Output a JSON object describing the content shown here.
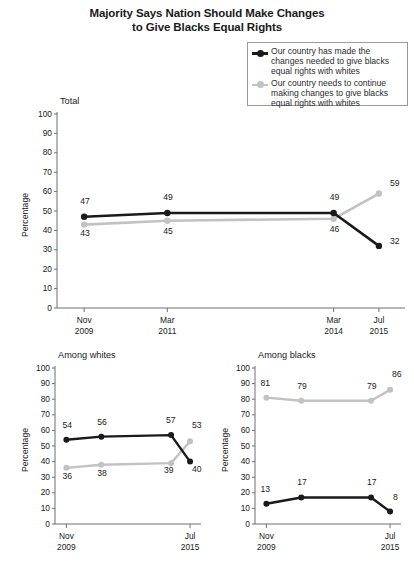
{
  "title": {
    "line1": "Majority Says Nation Should Make Changes",
    "line2": "to Give Blacks Equal Rights"
  },
  "legend": {
    "items": [
      {
        "label": "Our country has made the changes needed to give blacks equal rights with whites",
        "color": "#1a1a1a",
        "marker": "black-dot-line-marker"
      },
      {
        "label": "Our country needs to continue making changes to give blacks equal rights with whites",
        "color": "#c2c2c2",
        "marker": "gray-dot-line-marker"
      }
    ]
  },
  "colors": {
    "series_made_changes": "#1a1a1a",
    "series_needs_changes": "#c2c2c2",
    "axis": "#6f6f6f",
    "background": "#ffffff"
  },
  "chart_data": [
    {
      "type": "line",
      "title": "Total",
      "xlabel": "",
      "ylabel": "Percentage",
      "ylim": [
        0,
        100
      ],
      "yticks": [
        0,
        10,
        20,
        30,
        40,
        50,
        60,
        70,
        80,
        90,
        100
      ],
      "grid": false,
      "legend_position": "top-right",
      "x": [
        2009.83,
        2011.17,
        2014.17,
        2015.5
      ],
      "categories": [
        "Nov 2009",
        "Mar 2011",
        "Mar 2014",
        "Jul 2015"
      ],
      "xtick_labels": [
        {
          "line1": "Nov",
          "line2": "2009"
        },
        {
          "line1": "Mar",
          "line2": "2011"
        },
        {
          "line1": "Mar",
          "line2": "2014"
        },
        {
          "line1": "Jul",
          "line2": "2015"
        }
      ],
      "series": [
        {
          "name": "Our country has made the changes needed to give blacks equal rights with whites",
          "color": "#1a1a1a",
          "values": [
            47,
            49,
            49,
            32
          ]
        },
        {
          "name": "Our country needs to continue making changes to give blacks equal rights with whites",
          "color": "#c2c2c2",
          "values": [
            43,
            45,
            46,
            59
          ]
        }
      ]
    },
    {
      "type": "line",
      "title": "Among whites",
      "xlabel": "",
      "ylabel": "Percentage",
      "ylim": [
        0,
        100
      ],
      "yticks": [
        0,
        10,
        20,
        30,
        40,
        50,
        60,
        70,
        80,
        90,
        100
      ],
      "grid": false,
      "x": [
        2009.83,
        2011.17,
        2014.17,
        2015.5
      ],
      "categories": [
        "Nov 2009",
        "Mar 2011",
        "Mar 2014",
        "Jul 2015"
      ],
      "xtick_labels": [
        {
          "line1": "Nov",
          "line2": "2009"
        },
        {
          "line1": "Jul",
          "line2": "2015"
        }
      ],
      "series": [
        {
          "name": "Our country has made the changes needed to give blacks equal rights with whites",
          "color": "#1a1a1a",
          "values": [
            54,
            56,
            57,
            40
          ]
        },
        {
          "name": "Our country needs to continue making changes to give blacks equal rights with whites",
          "color": "#c2c2c2",
          "values": [
            36,
            38,
            39,
            53
          ]
        }
      ]
    },
    {
      "type": "line",
      "title": "Among blacks",
      "xlabel": "",
      "ylabel": "Percentage",
      "ylim": [
        0,
        100
      ],
      "yticks": [
        0,
        10,
        20,
        30,
        40,
        50,
        60,
        70,
        80,
        90,
        100
      ],
      "grid": false,
      "x": [
        2009.83,
        2011.17,
        2014.17,
        2015.5
      ],
      "categories": [
        "Nov 2009",
        "Mar 2011",
        "Mar 2014",
        "Jul 2015"
      ],
      "xtick_labels": [
        {
          "line1": "Nov",
          "line2": "2009"
        },
        {
          "line1": "Jul",
          "line2": "2015"
        }
      ],
      "series": [
        {
          "name": "Our country has made the changes needed to give blacks equal rights with whites",
          "color": "#1a1a1a",
          "values": [
            13,
            17,
            17,
            8
          ]
        },
        {
          "name": "Our country needs to continue making changes to give blacks equal rights with whites",
          "color": "#c2c2c2",
          "values": [
            81,
            79,
            79,
            86
          ]
        }
      ]
    }
  ]
}
